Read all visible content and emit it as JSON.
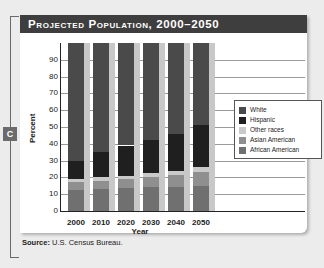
{
  "badge": "C",
  "chart_data": {
    "type": "bar",
    "stacked": true,
    "title": "Projected Population, 2000–2050",
    "xlabel": "Year",
    "ylabel": "Percent",
    "ylim": [
      0,
      100
    ],
    "yticks": [
      0,
      10,
      20,
      30,
      40,
      50,
      60,
      70,
      80,
      90
    ],
    "grid": true,
    "legend_position": "right",
    "categories": [
      "2000",
      "2010",
      "2020",
      "2030",
      "2040",
      "2050"
    ],
    "series": [
      {
        "name": "African American",
        "color": "#707070",
        "values": [
          12.5,
          13,
          13.5,
          14,
          14.5,
          15
        ]
      },
      {
        "name": "Asian American",
        "color": "#8f8f8f",
        "values": [
          4.5,
          5,
          5.5,
          6,
          7,
          8
        ]
      },
      {
        "name": "Other races",
        "color": "#c9c9c9",
        "values": [
          2,
          2,
          2,
          2.5,
          2.5,
          3
        ]
      },
      {
        "name": "Hispanic",
        "color": "#1f1f1f",
        "values": [
          11,
          15,
          18,
          20,
          22,
          25
        ]
      },
      {
        "name": "White",
        "color": "#4a4a4a",
        "values": [
          70,
          65,
          61,
          57.5,
          54,
          49
        ]
      }
    ]
  },
  "legend": [
    {
      "label": "White",
      "color": "#4a4a4a"
    },
    {
      "label": "Hispanic",
      "color": "#1f1f1f"
    },
    {
      "label": "Other races",
      "color": "#c9c9c9"
    },
    {
      "label": "Asian American",
      "color": "#8f8f8f"
    },
    {
      "label": "African American",
      "color": "#707070"
    }
  ],
  "source": {
    "label": "Source:",
    "text": " U.S. Census Bureau."
  }
}
